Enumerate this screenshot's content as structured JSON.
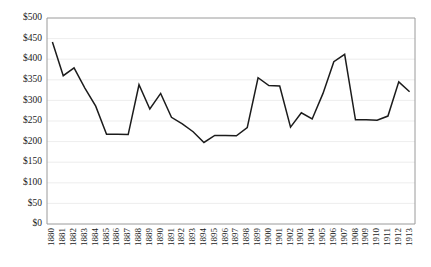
{
  "chart_data": {
    "type": "line",
    "title": "",
    "subtitle": "",
    "xlabel": "",
    "ylabel": "",
    "grid": true,
    "legend": "none",
    "ylim": [
      0,
      500
    ],
    "y_tick_step": 50,
    "y_tick_labels": [
      "$0",
      "$50",
      "$100",
      "$150",
      "$200",
      "$250",
      "$300",
      "$350",
      "$400",
      "$450",
      "$500"
    ],
    "y_tick_values": [
      0,
      50,
      100,
      150,
      200,
      250,
      300,
      350,
      400,
      450,
      500
    ],
    "currency_prefix": "$",
    "categories": [
      "1880",
      "1881",
      "1882",
      "1883",
      "1884",
      "1885",
      "1886",
      "1887",
      "1888",
      "1889",
      "1890",
      "1891",
      "1892",
      "1893",
      "1894",
      "1895",
      "1896",
      "1897",
      "1898",
      "1899",
      "1900",
      "1901",
      "1902",
      "1903",
      "1904",
      "1905",
      "1906",
      "1907",
      "1908",
      "1909",
      "1910",
      "1911",
      "1912",
      "1913"
    ],
    "values": [
      442,
      360,
      379,
      330,
      286,
      218,
      218,
      217,
      338,
      279,
      317,
      259,
      243,
      224,
      198,
      215,
      215,
      214,
      234,
      355,
      336,
      335,
      235,
      270,
      255,
      317,
      394,
      412,
      253,
      253,
      252,
      262,
      345,
      321
    ],
    "series": [
      {
        "name": "",
        "color": "#1c1c1c",
        "values": [
          442,
          360,
          379,
          330,
          286,
          218,
          218,
          217,
          338,
          279,
          317,
          259,
          243,
          224,
          198,
          215,
          215,
          214,
          234,
          355,
          336,
          335,
          235,
          270,
          255,
          317,
          394,
          412,
          253,
          253,
          252,
          262,
          345,
          321
        ]
      }
    ]
  },
  "colors": {
    "line": "#1c1c1c",
    "grid": "#e8e8e8",
    "axis": "#9a9a9a",
    "text": "#1a1a1a",
    "background": "#ffffff"
  }
}
